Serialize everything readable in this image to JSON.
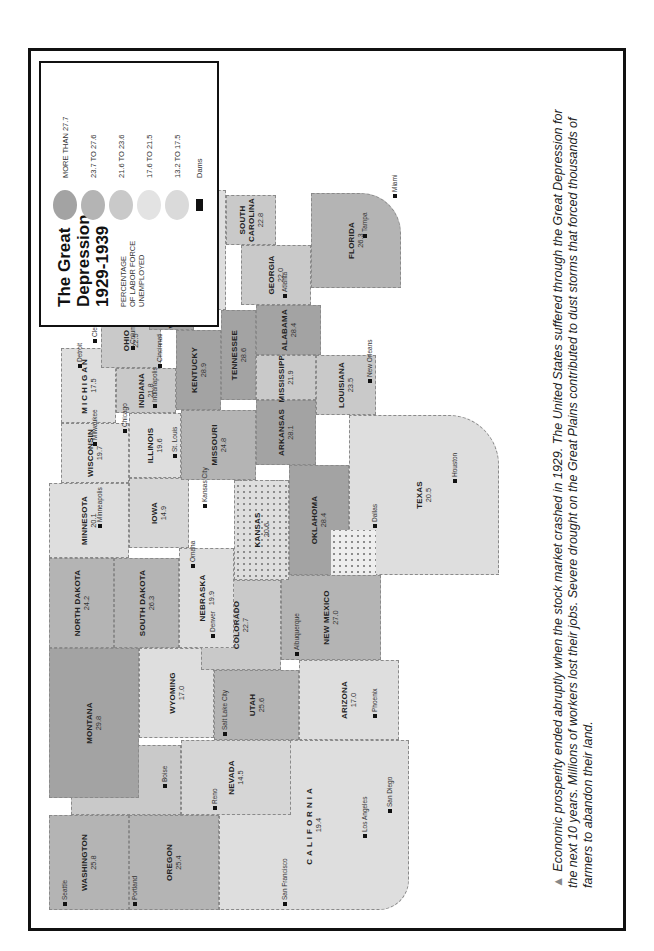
{
  "legend": {
    "title_line1": "The Great",
    "title_line2": "Depression",
    "title_line3": "1929-1939",
    "subtitle_line1": "PERCENTAGE",
    "subtitle_line2": "OF LABOR FORCE",
    "subtitle_line3": "UNEMPLOYED",
    "items": [
      {
        "label": "MORE THAN 27.7",
        "color": "#a3a3a3"
      },
      {
        "label": "23.7 TO 27.6",
        "color": "#b4b4b4"
      },
      {
        "label": "21.6 TO 23.6",
        "color": "#c9c9c9"
      },
      {
        "label": "17.6 TO 21.5",
        "color": "#dedede"
      },
      {
        "label": "13.2 TO 17.5",
        "color": "#d6d6d6"
      }
    ],
    "dams_label": "Dams"
  },
  "scale": {
    "miles_label": "Miles",
    "km_label": "Kilometers",
    "miles_ticks": [
      "0",
      "100",
      "200"
    ],
    "km_ticks": [
      "0",
      "100",
      "200",
      "300"
    ]
  },
  "states": {
    "washington": {
      "name": "WASHINGTON",
      "value": "25.8"
    },
    "oregon": {
      "name": "OREGON",
      "value": "25.4"
    },
    "california": {
      "name": "CALIFORNIA",
      "value": "19.4"
    },
    "idaho": {
      "name": "IDAHO",
      "value": "23.4"
    },
    "nevada": {
      "name": "NEVADA",
      "value": "14.5"
    },
    "montana": {
      "name": "MONTANA",
      "value": "29.8"
    },
    "wyoming": {
      "name": "WYOMING",
      "value": "17.0"
    },
    "utah": {
      "name": "UTAH",
      "value": "25.6"
    },
    "arizona": {
      "name": "ARIZONA",
      "value": "17.0"
    },
    "colorado": {
      "name": "COLORADO",
      "value": "22.7"
    },
    "new_mexico": {
      "name": "NEW MEXICO",
      "value": "27.0"
    },
    "north_dakota": {
      "name": "NORTH DAKOTA",
      "value": "24.2"
    },
    "south_dakota": {
      "name": "SOUTH DAKOTA",
      "value": "26.3"
    },
    "nebraska": {
      "name": "NEBRASKA",
      "value": "19.9"
    },
    "kansas": {
      "name": "KANSAS",
      "value": "20.6"
    },
    "oklahoma": {
      "name": "OKLAHOMA",
      "value": "28.4"
    },
    "texas": {
      "name": "TEXAS",
      "value": "20.5"
    },
    "minnesota": {
      "name": "MINNESOTA",
      "value": "20.1"
    },
    "iowa": {
      "name": "IOWA",
      "value": "14.9"
    },
    "missouri": {
      "name": "MISSOURI",
      "value": "24.8"
    },
    "arkansas": {
      "name": "ARKANSAS",
      "value": "28.1"
    },
    "louisiana": {
      "name": "LOUISIANA",
      "value": "23.5"
    },
    "wisconsin": {
      "name": "WISCONSIN",
      "value": "19.7"
    },
    "illinois": {
      "name": "ILLINOIS",
      "value": "19.6"
    },
    "michigan": {
      "name": "MICHIGAN",
      "value": "17.5"
    },
    "indiana": {
      "name": "INDIANA",
      "value": "21.8"
    },
    "ohio": {
      "name": "OHIO",
      "value": "22.5"
    },
    "kentucky": {
      "name": "KENTUCKY",
      "value": "28.9"
    },
    "tennessee": {
      "name": "TENNESSEE",
      "value": "28.6"
    },
    "mississippi": {
      "name": "MISSISSIPPI",
      "value": "21.9"
    },
    "alabama": {
      "name": "ALABAMA",
      "value": "28.4"
    },
    "georgia": {
      "name": "GEORGIA",
      "value": "22.0"
    },
    "florida": {
      "name": "FLORIDA",
      "value": "26.3"
    },
    "south_carolina": {
      "name": "SOUTH CAROLINA",
      "value": "22.8"
    },
    "north_carolina": {
      "name": "NORTH CAROLINA",
      "value": "18.0"
    },
    "virginia": {
      "name": "VIRGINIA",
      "value": "18.9"
    },
    "west_virginia": {
      "name": "WEST VIRGINIA",
      "value": "27.9"
    },
    "pennsylvania": {
      "name": "PENNSYLVANIA",
      "value": "28.3"
    },
    "new_york": {
      "name": "NEW YORK",
      "value": "23.4"
    },
    "vermont": {
      "name": "VT",
      "value": "15.7"
    },
    "new_hampshire": {
      "name": "N.H.",
      "value": "28.0"
    },
    "maine": {
      "name": "MAINE",
      "value": "23.6"
    },
    "new_jersey": {
      "name": "N.J.",
      "value": ""
    }
  },
  "cities": [
    "Seattle",
    "Portland",
    "San Francisco",
    "Los Angeles",
    "San Diego",
    "Reno",
    "Boise",
    "Salt Lake City",
    "Phoenix",
    "Albuquerque",
    "Denver",
    "Omaha",
    "Kansas City",
    "Dallas",
    "Houston",
    "Minneapolis",
    "St. Louis",
    "New Orleans",
    "Milwaukee",
    "Chicago",
    "Detroit",
    "Indianapolis",
    "Cleveland",
    "Columbus",
    "Cincinnati",
    "Atlanta",
    "Tampa",
    "Miami",
    "Raleigh",
    "Washington, D.C.",
    "Pittsburgh",
    "Philadelphia",
    "Buffalo",
    "Newark",
    "New York",
    "Boston"
  ],
  "caption": "Economic prosperity ended abruptly when the stock market crashed in 1929. The United States suffered through the Great Depression for the next 10 years. Millions of workers lost their jobs. Severe drought on the Great Plains contributed to dust storms that forced thousands of farmers to abandon their land."
}
